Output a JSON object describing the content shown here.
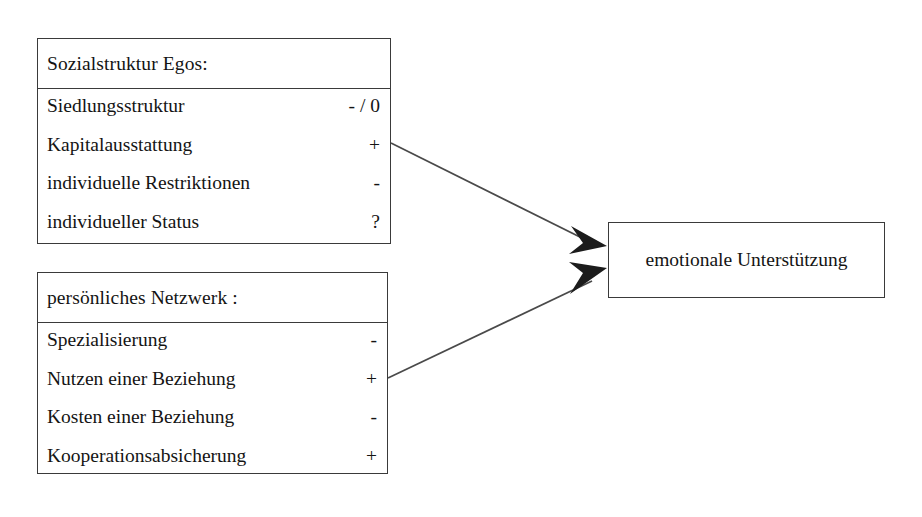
{
  "diagram": {
    "title_text": "",
    "background_color": "#ffffff",
    "line_color": "#4a4a4a",
    "arrow_color": "#1c1c1c",
    "border_color": "#3a3a3a",
    "text_color": "#141414"
  },
  "boxes": {
    "social": {
      "header": "Sozialstruktur Egos:",
      "rows": [
        {
          "label": "Siedlungsstruktur",
          "value": "- / 0"
        },
        {
          "label": "Kapitalausstattung",
          "value": "+"
        },
        {
          "label": "individuelle Restriktionen",
          "value": "-"
        },
        {
          "label": "individueller Status",
          "value": "?"
        }
      ]
    },
    "network": {
      "header": "persönliches Netzwerk :",
      "rows": [
        {
          "label": "Spezialisierung",
          "value": "-"
        },
        {
          "label": "Nutzen einer Beziehung",
          "value": "+"
        },
        {
          "label": "Kosten einer Beziehung",
          "value": "-"
        },
        {
          "label": "Kooperationsabsicherung",
          "value": "+"
        }
      ]
    },
    "outcome": {
      "label": "emotionale Unterstützung"
    }
  },
  "connectors": [
    {
      "name": "social-to-outcome",
      "from": "Sozialstruktur Egos:",
      "to": "emotionale Unterstützung",
      "direction": "down-right"
    },
    {
      "name": "network-to-outcome",
      "from": "persönliches Netzwerk :",
      "to": "emotionale Unterstützung",
      "direction": "up-right"
    }
  ]
}
